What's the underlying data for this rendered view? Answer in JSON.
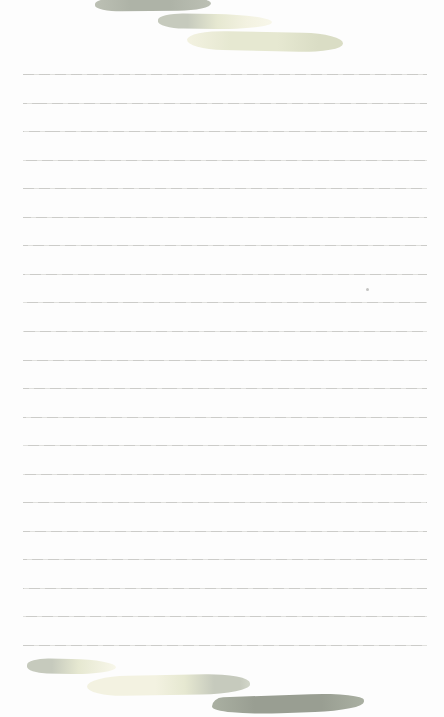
{
  "page": {
    "kind": "blank-lined-note-paper",
    "width_px": 444,
    "height_px": 717
  },
  "ruled_lines": {
    "count": 21,
    "first_y": 74,
    "spacing": 28.55,
    "left": 23,
    "right": 427
  },
  "decorations": {
    "top_strokes": [
      {
        "name": "brush-stroke-top-olive",
        "style": "solid olive-gray brush dab"
      },
      {
        "name": "brush-stroke-top-sage-fade",
        "style": "sage green fading to pale yellow tail"
      },
      {
        "name": "brush-stroke-top-pale-green",
        "style": "pale yellow-green wide brush dab"
      }
    ],
    "bottom_strokes": [
      {
        "name": "brush-stroke-bottom-sage-fade",
        "style": "sage green fading to pale yellow tail"
      },
      {
        "name": "brush-stroke-bottom-pale-sage",
        "style": "pale yellow brush dab ending in sage green"
      },
      {
        "name": "brush-stroke-bottom-olive",
        "style": "solid dark olive-gray brush dab"
      }
    ],
    "speck": {
      "name": "ink-speck",
      "note": "tiny gray dot between rules"
    }
  },
  "colors": {
    "paper_bg": "#fdfdfd",
    "rule_line": "#c9c9c6",
    "rule_line_light": "#dfdfdc",
    "olive_gray": "#aeb3a7",
    "olive_gray_light": "#bcc0b4",
    "olive_gray_dark": "#999e92",
    "olive_gray_dark_light": "#aab0a2",
    "gray_green": "#c6cabd",
    "gray_green_light": "#d2d6c9",
    "pale_yellow": "#f3f2e1",
    "pale_yellow_faint": "#f8f7ea",
    "pale_yellow_green": "#e6e8d1",
    "yellow_green_deep": "#daddc5",
    "speck": "#b5b5b3"
  }
}
